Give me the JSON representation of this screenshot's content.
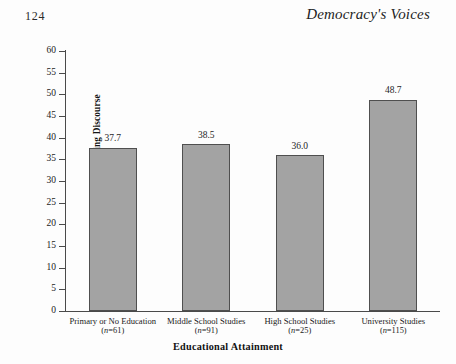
{
  "page": {
    "folio": "124",
    "running_head": "Democracy's Voices"
  },
  "chart_data": {
    "type": "bar",
    "title": "",
    "xlabel": "Educational Attainment",
    "ylabel": "Percentage Preferring Globalizing Discourse",
    "categories": [
      "Primary or No Education",
      "Middle School Studies",
      "High School Studies",
      "University Studies"
    ],
    "category_counts": [
      "(n=61)",
      "(n=91)",
      "(n=25)",
      "(n=115)"
    ],
    "n_values": [
      61,
      91,
      25,
      115
    ],
    "values": [
      37.7,
      38.5,
      36.0,
      48.7
    ],
    "value_labels": [
      "37.7",
      "38.5",
      "36.0",
      "48.7"
    ],
    "ylim": [
      0,
      60
    ],
    "ytick_step": 5,
    "yticks": [
      0,
      5,
      10,
      15,
      20,
      25,
      30,
      35,
      40,
      45,
      50,
      55,
      60
    ],
    "ytick_labels": [
      "0",
      "5",
      "10",
      "15",
      "20",
      "25",
      "30",
      "35",
      "40",
      "45",
      "50",
      "55",
      "60"
    ],
    "grid": false,
    "legend": false,
    "bar_color": "#a3a3a3",
    "bar_edge_color": "#4f4f4f",
    "axis_color": "#4a4a4a"
  }
}
